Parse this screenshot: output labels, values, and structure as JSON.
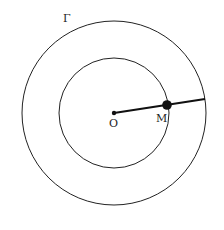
{
  "diagram": {
    "labels": {
      "outer_circle": "Γ",
      "center": "O",
      "point": "M"
    },
    "geometry": {
      "center": {
        "x": 114,
        "y": 113
      },
      "inner_radius": 55,
      "outer_radius": 92,
      "point_M": {
        "x": 167,
        "y": 104
      },
      "segment_end": {
        "x": 205,
        "y": 99
      }
    },
    "colors": {
      "stroke": "#222222",
      "background": "#ffffff"
    }
  }
}
